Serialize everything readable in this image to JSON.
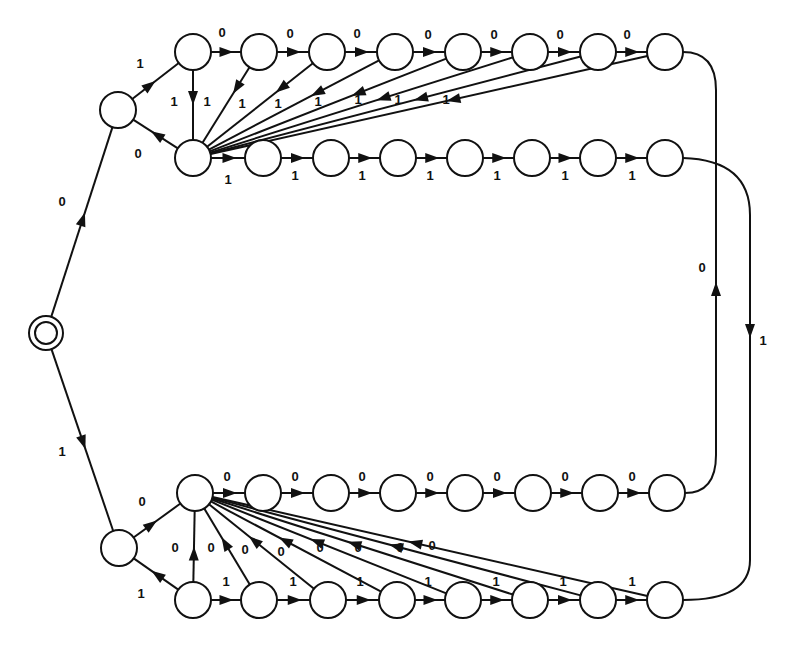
{
  "diagram": {
    "type": "state-transition-diagram",
    "colors": {
      "stroke": "#111111",
      "background": "#ffffff"
    },
    "node_radius": 18,
    "start": {
      "id": "S",
      "x": 46,
      "y": 333,
      "r": 17,
      "r_inner": 11
    },
    "nodes": [
      {
        "id": "A",
        "x": 118,
        "y": 110
      },
      {
        "id": "T0",
        "x": 193,
        "y": 52
      },
      {
        "id": "T1",
        "x": 259,
        "y": 52
      },
      {
        "id": "T2",
        "x": 327,
        "y": 52
      },
      {
        "id": "T3",
        "x": 395,
        "y": 52
      },
      {
        "id": "T4",
        "x": 463,
        "y": 52
      },
      {
        "id": "T5",
        "x": 530,
        "y": 52
      },
      {
        "id": "T6",
        "x": 598,
        "y": 52
      },
      {
        "id": "T7",
        "x": 665,
        "y": 52
      },
      {
        "id": "U0",
        "x": 193,
        "y": 158
      },
      {
        "id": "U1",
        "x": 263,
        "y": 158
      },
      {
        "id": "U2",
        "x": 331,
        "y": 158
      },
      {
        "id": "U3",
        "x": 398,
        "y": 158
      },
      {
        "id": "U4",
        "x": 465,
        "y": 158
      },
      {
        "id": "U5",
        "x": 532,
        "y": 158
      },
      {
        "id": "U6",
        "x": 598,
        "y": 158
      },
      {
        "id": "U7",
        "x": 665,
        "y": 158
      },
      {
        "id": "B",
        "x": 119,
        "y": 548
      },
      {
        "id": "L0",
        "x": 195,
        "y": 493
      },
      {
        "id": "L1",
        "x": 263,
        "y": 493
      },
      {
        "id": "L2",
        "x": 331,
        "y": 493
      },
      {
        "id": "L3",
        "x": 398,
        "y": 493
      },
      {
        "id": "L4",
        "x": 465,
        "y": 493
      },
      {
        "id": "L5",
        "x": 533,
        "y": 493
      },
      {
        "id": "L6",
        "x": 600,
        "y": 493
      },
      {
        "id": "L7",
        "x": 667,
        "y": 493
      },
      {
        "id": "M0",
        "x": 193,
        "y": 600
      },
      {
        "id": "M1",
        "x": 259,
        "y": 600
      },
      {
        "id": "M2",
        "x": 328,
        "y": 600
      },
      {
        "id": "M3",
        "x": 397,
        "y": 600
      },
      {
        "id": "M4",
        "x": 463,
        "y": 600
      },
      {
        "id": "M5",
        "x": 530,
        "y": 600
      },
      {
        "id": "M6",
        "x": 598,
        "y": 600
      },
      {
        "id": "M7",
        "x": 665,
        "y": 600
      }
    ],
    "edges": [
      {
        "from": "S",
        "to": "A",
        "label": "0",
        "lx": 62,
        "ly": 206,
        "t": 0.55
      },
      {
        "from": "S",
        "to": "B",
        "label": "1",
        "lx": 62,
        "ly": 456,
        "t": 0.55
      },
      {
        "from": "A",
        "to": "T0",
        "label": "1",
        "lx": 140,
        "ly": 68,
        "t": 0.5
      },
      {
        "from": "U0",
        "to": "A",
        "label": "0",
        "lx": 138,
        "ly": 158,
        "t": 0.6
      },
      {
        "from": "T0",
        "to": "T1",
        "label": "0",
        "lx": 222,
        "ly": 37,
        "t": 0.75
      },
      {
        "from": "T1",
        "to": "T2",
        "label": "0",
        "lx": 290,
        "ly": 38,
        "t": 0.75
      },
      {
        "from": "T2",
        "to": "T3",
        "label": "0",
        "lx": 357,
        "ly": 38,
        "t": 0.75
      },
      {
        "from": "T3",
        "to": "T4",
        "label": "0",
        "lx": 428,
        "ly": 39,
        "t": 0.75
      },
      {
        "from": "T4",
        "to": "T5",
        "label": "0",
        "lx": 494,
        "ly": 39,
        "t": 0.75
      },
      {
        "from": "T5",
        "to": "T6",
        "label": "0",
        "lx": 560,
        "ly": 39,
        "t": 0.75
      },
      {
        "from": "T6",
        "to": "T7",
        "label": "0",
        "lx": 627,
        "ly": 39,
        "t": 0.75
      },
      {
        "from": "T0",
        "to": "U0",
        "label": "1",
        "lx": 174,
        "ly": 106,
        "t": 0.5
      },
      {
        "from": "T1",
        "to": "U0",
        "label": "1",
        "lx": 207,
        "ly": 106,
        "t": 0.35
      },
      {
        "from": "T2",
        "to": "U0",
        "label": "1",
        "lx": 242,
        "ly": 108,
        "t": 0.35
      },
      {
        "from": "T3",
        "to": "U0",
        "label": "1",
        "lx": 278,
        "ly": 108,
        "t": 0.4
      },
      {
        "from": "T4",
        "to": "U0",
        "label": "1",
        "lx": 318,
        "ly": 106,
        "t": 0.4
      },
      {
        "from": "T5",
        "to": "U0",
        "label": "1",
        "lx": 358,
        "ly": 104,
        "t": 0.45
      },
      {
        "from": "T6",
        "to": "U0",
        "label": "1",
        "lx": 398,
        "ly": 104,
        "t": 0.45
      },
      {
        "from": "T7",
        "to": "U0",
        "label": "1",
        "lx": 446,
        "ly": 104,
        "t": 0.46
      },
      {
        "from": "U0",
        "to": "U1",
        "label": "1",
        "lx": 228,
        "ly": 184,
        "t": 0.75
      },
      {
        "from": "U1",
        "to": "U2",
        "label": "1",
        "lx": 295,
        "ly": 180,
        "t": 0.75
      },
      {
        "from": "U2",
        "to": "U3",
        "label": "1",
        "lx": 362,
        "ly": 180,
        "t": 0.75
      },
      {
        "from": "U3",
        "to": "U4",
        "label": "1",
        "lx": 430,
        "ly": 180,
        "t": 0.75
      },
      {
        "from": "U4",
        "to": "U5",
        "label": "1",
        "lx": 497,
        "ly": 180,
        "t": 0.75
      },
      {
        "from": "U5",
        "to": "U6",
        "label": "1",
        "lx": 565,
        "ly": 180,
        "t": 0.75
      },
      {
        "from": "U6",
        "to": "U7",
        "label": "1",
        "lx": 632,
        "ly": 180,
        "t": 0.75
      },
      {
        "from": "B",
        "to": "L0",
        "label": "0",
        "lx": 142,
        "ly": 506,
        "t": 0.5
      },
      {
        "from": "M0",
        "to": "B",
        "label": "1",
        "lx": 141,
        "ly": 598,
        "t": 0.6
      },
      {
        "from": "L0",
        "to": "L1",
        "label": "0",
        "lx": 227,
        "ly": 481,
        "t": 0.75
      },
      {
        "from": "L1",
        "to": "L2",
        "label": "0",
        "lx": 295,
        "ly": 481,
        "t": 0.75
      },
      {
        "from": "L2",
        "to": "L3",
        "label": "0",
        "lx": 362,
        "ly": 481,
        "t": 0.75
      },
      {
        "from": "L3",
        "to": "L4",
        "label": "0",
        "lx": 430,
        "ly": 481,
        "t": 0.75
      },
      {
        "from": "L4",
        "to": "L5",
        "label": "0",
        "lx": 497,
        "ly": 481,
        "t": 0.75
      },
      {
        "from": "L5",
        "to": "L6",
        "label": "0",
        "lx": 565,
        "ly": 481,
        "t": 0.75
      },
      {
        "from": "L6",
        "to": "L7",
        "label": "0",
        "lx": 632,
        "ly": 481,
        "t": 0.75
      },
      {
        "from": "M0",
        "to": "L0",
        "label": "0",
        "lx": 175,
        "ly": 552,
        "t": 0.5
      },
      {
        "from": "M1",
        "to": "L0",
        "label": "0",
        "lx": 211,
        "ly": 552,
        "t": 0.62
      },
      {
        "from": "M2",
        "to": "L0",
        "label": "0",
        "lx": 245,
        "ly": 554,
        "t": 0.62
      },
      {
        "from": "M3",
        "to": "L0",
        "label": "0",
        "lx": 281,
        "ly": 556,
        "t": 0.6
      },
      {
        "from": "M4",
        "to": "L0",
        "label": "0",
        "lx": 320,
        "ly": 552,
        "t": 0.58
      },
      {
        "from": "M5",
        "to": "L0",
        "label": "0",
        "lx": 358,
        "ly": 552,
        "t": 0.55
      },
      {
        "from": "M6",
        "to": "L0",
        "label": "0",
        "lx": 400,
        "ly": 552,
        "t": 0.52
      },
      {
        "from": "M7",
        "to": "L0",
        "label": "0",
        "lx": 432,
        "ly": 550,
        "t": 0.55
      },
      {
        "from": "M0",
        "to": "M1",
        "label": "1",
        "lx": 226,
        "ly": 586,
        "t": 0.75
      },
      {
        "from": "M1",
        "to": "M2",
        "label": "1",
        "lx": 293,
        "ly": 586,
        "t": 0.75
      },
      {
        "from": "M2",
        "to": "M3",
        "label": "1",
        "lx": 360,
        "ly": 586,
        "t": 0.75
      },
      {
        "from": "M3",
        "to": "M4",
        "label": "1",
        "lx": 428,
        "ly": 586,
        "t": 0.75
      },
      {
        "from": "M4",
        "to": "M5",
        "label": "1",
        "lx": 496,
        "ly": 586,
        "t": 0.75
      },
      {
        "from": "M5",
        "to": "M6",
        "label": "1",
        "lx": 563,
        "ly": 586,
        "t": 0.75
      },
      {
        "from": "M6",
        "to": "M7",
        "label": "1",
        "lx": 632,
        "ly": 586,
        "t": 0.75
      }
    ],
    "long_edges": [
      {
        "from": "T7",
        "to": "U0_route_right",
        "desc": "T7 down right rail to bottom-lower M7? no: T7 -> L7 via x=716 reversed",
        "path": "M 683 52 Q 716 52 716 90 L 716 455 Q 716 493 685 493",
        "label": "0",
        "lx": 702,
        "ly": 272,
        "arrow_x": 716,
        "arrow_y": 282,
        "arrow_dir": "up"
      },
      {
        "from": "U7",
        "to": "M7",
        "path": "M 683 158 Q 750 160 750 215 L 750 560 Q 750 600 683 600",
        "label": "1",
        "lx": 763,
        "ly": 345,
        "arrow_x": 750,
        "arrow_y": 338,
        "arrow_dir": "down"
      }
    ]
  }
}
